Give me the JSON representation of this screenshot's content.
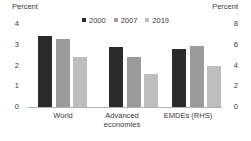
{
  "chart_data": {
    "type": "bar",
    "title": "",
    "left_axis": {
      "label": "Percent",
      "max": 4,
      "min": 0,
      "ticks": [
        4,
        3,
        2,
        1,
        0
      ]
    },
    "right_axis": {
      "label": "Percent",
      "max": 8,
      "min": 0,
      "ticks": [
        8,
        6,
        4,
        2,
        0
      ]
    },
    "categories": [
      {
        "label": "World",
        "axis": "left"
      },
      {
        "label": "Advanced economies",
        "axis": "left"
      },
      {
        "label": "EMDEs (RHS)",
        "axis": "right"
      }
    ],
    "series": [
      {
        "name": "2000",
        "color": "#2b2b2b",
        "values": [
          3.4,
          2.9,
          5.6
        ]
      },
      {
        "name": "2007",
        "color": "#9b9b9b",
        "values": [
          3.3,
          2.4,
          5.9
        ]
      },
      {
        "name": "2019",
        "color": "#bdbdbd",
        "values": [
          2.4,
          1.6,
          4.0
        ]
      }
    ],
    "legend_position": "top-center",
    "grid": false
  }
}
